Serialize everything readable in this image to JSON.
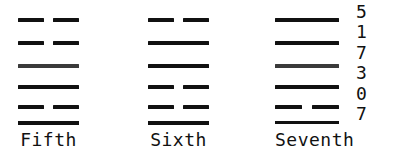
{
  "figure": {
    "type": "iching-hexagram-diagram",
    "ink_color": "#111111",
    "background_color": "#ffffff",
    "line_types": {
      "solid": "yang",
      "broken": "yin"
    },
    "hexagrams": [
      {
        "label": "Fifth",
        "lines": [
          "broken",
          "broken",
          "solid",
          "solid",
          "broken"
        ],
        "has_baseline_rule": true
      },
      {
        "label": "Sixth",
        "lines": [
          "broken",
          "solid",
          "solid",
          "broken",
          "broken"
        ],
        "has_baseline_rule": true
      },
      {
        "label": "Seventh",
        "lines": [
          "solid",
          "solid",
          "solid",
          "solid",
          "broken"
        ],
        "has_baseline_rule": true
      }
    ]
  },
  "digit_column": {
    "digits": [
      "5",
      "1",
      "7",
      "3",
      "0",
      "7"
    ]
  }
}
